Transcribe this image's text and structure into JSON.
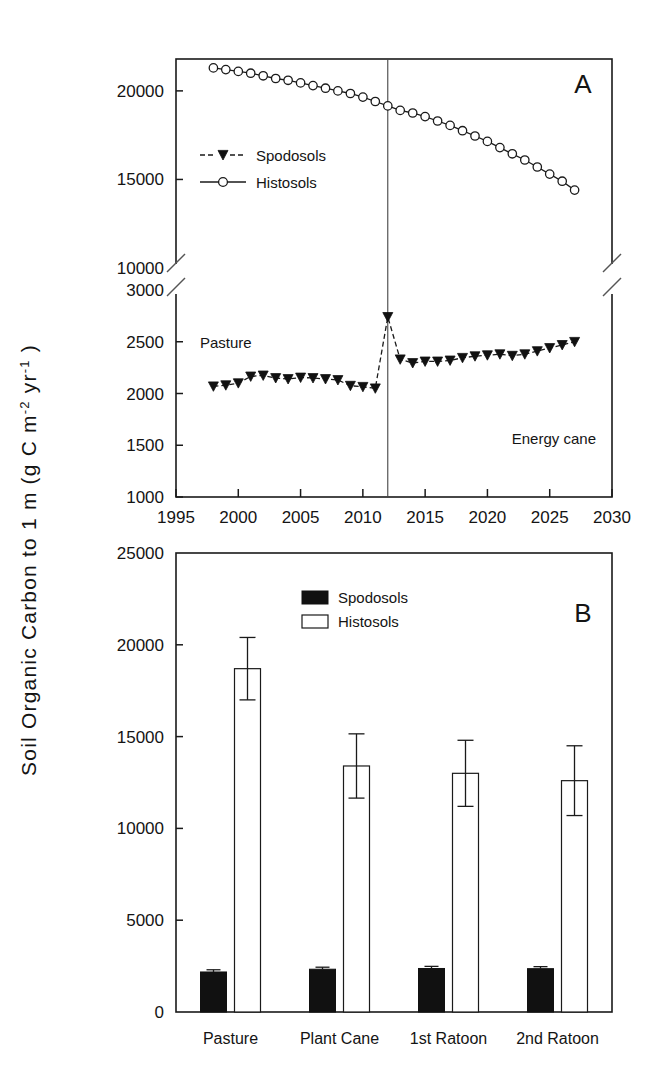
{
  "figure": {
    "y_axis_title_parts": [
      "Soil Organic Carbon to 1 m (g C m",
      "-2",
      " yr",
      "-1",
      " )"
    ],
    "y_axis_title_plain": "Soil Organic Carbon to 1 m (g C m-2 yr-1)"
  },
  "panelA": {
    "label": "A",
    "annotations": {
      "left": "Pasture",
      "right": "Energy cane"
    },
    "legend": [
      {
        "name": "Spodosols",
        "marker": "filled-triangle-down",
        "line": "dashed",
        "color": "#111111"
      },
      {
        "name": "Histosols",
        "marker": "open-circle",
        "line": "solid",
        "color": "#1a1a1a"
      }
    ],
    "divider_year": 2012,
    "x_ticks": [
      1995,
      2000,
      2005,
      2010,
      2015,
      2020,
      2025,
      2030
    ],
    "x_lim": [
      1995,
      2030
    ],
    "y_upper_ticks": [
      10000,
      15000,
      20000
    ],
    "y_upper_lim": [
      10000,
      21800
    ],
    "y_lower_ticks": [
      1000,
      1500,
      2000,
      2500,
      3000
    ],
    "y_lower_lim": [
      1000,
      3000
    ],
    "axis_break": true,
    "chart_data": {
      "type": "line",
      "title": "A",
      "xlabel": "",
      "ylabel": "Soil Organic Carbon to 1 m (g C m-2 yr-1)",
      "xlim": [
        1995,
        2030
      ],
      "ylim_upper": [
        10000,
        21800
      ],
      "ylim_lower": [
        1000,
        3000
      ],
      "grid": false,
      "legend_position": "inside-left",
      "series": [
        {
          "name": "Histosols",
          "marker": "open-circle",
          "axis": "upper",
          "x": [
            1998,
            1999,
            2000,
            2001,
            2002,
            2003,
            2004,
            2005,
            2006,
            2007,
            2008,
            2009,
            2010,
            2011,
            2012,
            2013,
            2014,
            2015,
            2016,
            2017,
            2018,
            2019,
            2020,
            2021,
            2022,
            2023,
            2024,
            2025,
            2026,
            2027
          ],
          "values": [
            21300,
            21200,
            21100,
            21000,
            20850,
            20700,
            20600,
            20450,
            20300,
            20150,
            20000,
            19850,
            19650,
            19400,
            19150,
            18900,
            18750,
            18550,
            18300,
            18050,
            17750,
            17450,
            17150,
            16800,
            16450,
            16100,
            15700,
            15300,
            14900,
            14400
          ]
        },
        {
          "name": "Spodosols",
          "marker": "filled-triangle-down",
          "axis": "lower",
          "x": [
            1998,
            1999,
            2000,
            2001,
            2002,
            2003,
            2004,
            2005,
            2006,
            2007,
            2008,
            2009,
            2010,
            2011,
            2012,
            2013,
            2014,
            2015,
            2016,
            2017,
            2018,
            2019,
            2020,
            2021,
            2022,
            2023,
            2024,
            2025,
            2026,
            2027
          ],
          "values": [
            2070,
            2080,
            2100,
            2165,
            2175,
            2150,
            2140,
            2155,
            2150,
            2140,
            2130,
            2075,
            2065,
            2050,
            2740,
            2330,
            2295,
            2310,
            2310,
            2320,
            2345,
            2360,
            2370,
            2380,
            2365,
            2380,
            2410,
            2440,
            2470,
            2500
          ]
        }
      ]
    }
  },
  "panelB": {
    "label": "B",
    "legend": [
      {
        "name": "Spodosols",
        "swatch": "filled"
      },
      {
        "name": "Histosols",
        "swatch": "open"
      }
    ],
    "y_ticks": [
      0,
      5000,
      10000,
      15000,
      20000,
      25000
    ],
    "y_lim": [
      0,
      25000
    ],
    "chart_data": {
      "type": "bar",
      "title": "B",
      "xlabel": "",
      "ylabel": "Soil Organic Carbon to 1 m (g C m-2 yr-1)",
      "ylim": [
        0,
        25000
      ],
      "grid": false,
      "legend_position": "top-center",
      "categories": [
        "Pasture",
        "Plant Cane",
        "1st Ratoon",
        "2nd Ratoon"
      ],
      "series": [
        {
          "name": "Spodosols",
          "swatch": "filled",
          "values": [
            2180,
            2330,
            2370,
            2360
          ],
          "errors": [
            120,
            110,
            115,
            110
          ]
        },
        {
          "name": "Histosols",
          "swatch": "open",
          "values": [
            18700,
            13400,
            13000,
            12600
          ],
          "errors": [
            1700,
            1750,
            1800,
            1900
          ]
        }
      ]
    }
  }
}
